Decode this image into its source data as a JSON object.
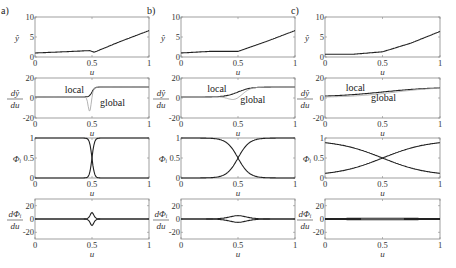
{
  "panels": [
    {
      "label": "a)",
      "width_param": "narrow"
    },
    {
      "label": "b)",
      "width_param": "medium"
    },
    {
      "label": "c)",
      "width_param": "wide"
    }
  ],
  "rows": [
    {
      "ylabel": "ŷ",
      "yticks": [
        "0",
        "5",
        "10"
      ],
      "ylim": [
        0,
        10
      ]
    },
    {
      "ylabel_num": "dŷ",
      "ylabel_den": "du",
      "yticks": [
        "-20",
        "0",
        "20"
      ],
      "ylim": [
        -20,
        20
      ],
      "annotations": [
        "local",
        "global"
      ]
    },
    {
      "ylabel": "Φᵢ",
      "yticks": [
        "0",
        "0.5",
        "1"
      ],
      "ylim": [
        0,
        1
      ]
    },
    {
      "ylabel_num": "dΦᵢ",
      "ylabel_den": "du",
      "yticks": [
        "-20",
        "0",
        "20"
      ],
      "ylim": [
        -30,
        30
      ]
    }
  ],
  "xticks": [
    "0",
    "0.5",
    "1"
  ],
  "xlabel": "u",
  "chart_data": {
    "type": "line",
    "title": "",
    "grid": false,
    "xlabel": "u",
    "xlim": [
      0,
      1
    ],
    "layout": "4 rows x 3 columns (a, b, c)",
    "subplots": [
      {
        "panel": "a",
        "row": 1,
        "ylabel": "y-hat",
        "ylim": [
          0,
          10
        ],
        "series": [
          {
            "name": "y-hat",
            "x": [
              0,
              0.25,
              0.48,
              0.52,
              0.75,
              1
            ],
            "y": [
              1.0,
              1.3,
              1.6,
              1.2,
              3.9,
              6.6
            ]
          }
        ]
      },
      {
        "panel": "a",
        "row": 2,
        "ylabel": "dy-hat/du",
        "ylim": [
          -20,
          20
        ],
        "series": [
          {
            "name": "local",
            "x": [
              0,
              0.45,
              0.5,
              0.55,
              1
            ],
            "y": [
              1,
              1,
              6,
              11,
              11
            ]
          },
          {
            "name": "global",
            "x": [
              0,
              0.45,
              0.5,
              0.52,
              0.55,
              1
            ],
            "y": [
              1,
              1,
              -14,
              -4,
              11,
              11
            ]
          }
        ]
      },
      {
        "panel": "a",
        "row": 3,
        "ylabel": "Phi_i",
        "ylim": [
          0,
          1
        ],
        "series": [
          {
            "name": "Phi_1",
            "x": [
              0,
              0.45,
              0.5,
              0.55,
              1
            ],
            "y": [
              1,
              0.98,
              0.5,
              0.02,
              0
            ]
          },
          {
            "name": "Phi_2",
            "x": [
              0,
              0.45,
              0.5,
              0.55,
              1
            ],
            "y": [
              0,
              0.02,
              0.5,
              0.98,
              1
            ]
          }
        ]
      },
      {
        "panel": "a",
        "row": 4,
        "ylabel": "dPhi_i/du",
        "ylim": [
          -30,
          30
        ],
        "series": [
          {
            "name": "dPhi_1",
            "x": [
              0,
              0.45,
              0.5,
              0.55,
              1
            ],
            "y": [
              0,
              0,
              -25,
              0,
              0
            ]
          },
          {
            "name": "dPhi_2",
            "x": [
              0,
              0.45,
              0.5,
              0.55,
              1
            ],
            "y": [
              0,
              0,
              25,
              0,
              0
            ]
          }
        ]
      },
      {
        "panel": "b",
        "row": 1,
        "ylabel": "y-hat",
        "ylim": [
          0,
          10
        ],
        "series": [
          {
            "name": "y-hat",
            "x": [
              0,
              0.25,
              0.5,
              0.75,
              1
            ],
            "y": [
              1.0,
              1.4,
              1.4,
              3.9,
              6.6
            ]
          }
        ]
      },
      {
        "panel": "b",
        "row": 2,
        "ylabel": "dy-hat/du",
        "ylim": [
          -20,
          20
        ],
        "series": [
          {
            "name": "local",
            "x": [
              0,
              0.35,
              0.5,
              0.65,
              1
            ],
            "y": [
              1,
              1,
              6,
              11,
              11
            ]
          },
          {
            "name": "global",
            "x": [
              0,
              0.35,
              0.47,
              0.55,
              0.65,
              1
            ],
            "y": [
              1,
              0,
              -4,
              2,
              11,
              11
            ]
          }
        ]
      },
      {
        "panel": "b",
        "row": 3,
        "ylabel": "Phi_i",
        "ylim": [
          0,
          1
        ],
        "series": [
          {
            "name": "Phi_1",
            "x": [
              0,
              0.3,
              0.5,
              0.7,
              1
            ],
            "y": [
              1,
              0.97,
              0.5,
              0.03,
              0
            ]
          },
          {
            "name": "Phi_2",
            "x": [
              0,
              0.3,
              0.5,
              0.7,
              1
            ],
            "y": [
              0,
              0.03,
              0.5,
              0.97,
              1
            ]
          }
        ]
      },
      {
        "panel": "b",
        "row": 4,
        "ylabel": "dPhi_i/du",
        "ylim": [
          -30,
          30
        ],
        "series": [
          {
            "name": "dPhi_1",
            "x": [
              0,
              0.35,
              0.5,
              0.65,
              1
            ],
            "y": [
              0,
              0,
              -7,
              0,
              0
            ]
          },
          {
            "name": "dPhi_2",
            "x": [
              0,
              0.35,
              0.5,
              0.65,
              1
            ],
            "y": [
              0,
              0,
              7,
              0,
              0
            ]
          }
        ]
      },
      {
        "panel": "c",
        "row": 1,
        "ylabel": "y-hat",
        "ylim": [
          0,
          10
        ],
        "series": [
          {
            "name": "y-hat",
            "x": [
              0,
              0.25,
              0.5,
              0.75,
              1
            ],
            "y": [
              0.7,
              0.7,
              1.3,
              3.5,
              6.4
            ]
          }
        ]
      },
      {
        "panel": "c",
        "row": 2,
        "ylabel": "dy-hat/du",
        "ylim": [
          -20,
          20
        ],
        "series": [
          {
            "name": "local",
            "x": [
              0,
              0.25,
              0.5,
              0.75,
              1
            ],
            "y": [
              2,
              3.5,
              6,
              10,
              11
            ]
          },
          {
            "name": "global",
            "x": [
              0,
              0.25,
              0.5,
              0.75,
              1
            ],
            "y": [
              1,
              2,
              5,
              9.5,
              11
            ]
          }
        ]
      },
      {
        "panel": "c",
        "row": 3,
        "ylabel": "Phi_i",
        "ylim": [
          0,
          1
        ],
        "series": [
          {
            "name": "Phi_1",
            "x": [
              0,
              0.25,
              0.5,
              0.75,
              1
            ],
            "y": [
              0.95,
              0.8,
              0.5,
              0.2,
              0.05
            ]
          },
          {
            "name": "Phi_2",
            "x": [
              0,
              0.25,
              0.5,
              0.75,
              1
            ],
            "y": [
              0.05,
              0.2,
              0.5,
              0.8,
              0.95
            ]
          }
        ]
      },
      {
        "panel": "c",
        "row": 4,
        "ylabel": "dPhi_i/du",
        "ylim": [
          -30,
          30
        ],
        "series": [
          {
            "name": "dPhi_1",
            "x": [
              0,
              0.5,
              1
            ],
            "y": [
              -0.5,
              -1.5,
              -0.5
            ]
          },
          {
            "name": "dPhi_2",
            "x": [
              0,
              0.5,
              1
            ],
            "y": [
              0.5,
              1.5,
              0.5
            ]
          }
        ]
      }
    ]
  }
}
